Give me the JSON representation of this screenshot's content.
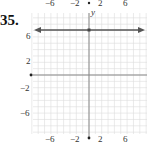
{
  "problem": {
    "number": "35."
  },
  "chart_data": {
    "type": "line",
    "title": "",
    "xlabel": "",
    "ylabel": "y",
    "xlim": [
      -9,
      9
    ],
    "ylim": [
      -9,
      9
    ],
    "grid": true,
    "x_ticks": [
      "-6",
      "-2",
      "2",
      "6"
    ],
    "y_ticks": [
      "6",
      "2",
      "-2",
      "-6"
    ],
    "series": [
      {
        "name": "y = 7",
        "equation": "y = 7",
        "x": [
          -9,
          9
        ],
        "values": [
          7,
          7
        ],
        "arrows": "both"
      }
    ],
    "annotations": [
      "point on y-axis at (0, 7)"
    ]
  },
  "colors": {
    "grid": "#d4d4d4",
    "axis": "#777777",
    "line": "#555555"
  }
}
